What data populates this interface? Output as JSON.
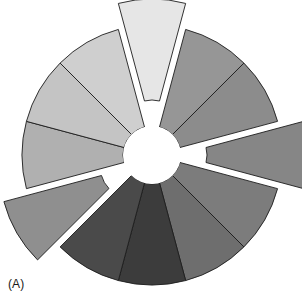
{
  "figure": {
    "panel_label": "(A)",
    "background_color": "#ffffff",
    "outline_color": "#1d1d1d",
    "hub_color": "#ffffff"
  },
  "chart_data": {
    "type": "pie",
    "title": "",
    "subtitle": "",
    "xlabel": "",
    "ylabel": "",
    "variant": "exploded-donut",
    "grid": false,
    "legend_position": "none",
    "center_x": 152,
    "center_y": 155,
    "outer_radius": 130,
    "inner_radius": 29,
    "start_angle_deg": -105,
    "direction": "clockwise",
    "explode_offset": 26,
    "categories": [
      "Segment 1",
      "Segment 2",
      "Segment 3",
      "Segment 4",
      "Segment 5",
      "Segment 6",
      "Segment 7",
      "Segment 8",
      "Segment 9",
      "Segment 10",
      "Segment 11",
      "Segment 12"
    ],
    "values": [
      8.33,
      8.33,
      8.33,
      8.33,
      8.33,
      8.33,
      8.33,
      8.33,
      8.33,
      8.33,
      8.33,
      8.33
    ],
    "slice_angles_deg": [
      30,
      30,
      30,
      30,
      30,
      30,
      30,
      30,
      30,
      30,
      30,
      30
    ],
    "colors": [
      "#e6e6e6",
      "#969696",
      "#8c8c8c",
      "#868686",
      "#7c7c7c",
      "#6e6e6e",
      "#3c3c3c",
      "#4a4a4a",
      "#8f8f8f",
      "#b0b0b0",
      "#c4c4c4",
      "#cfcfcf"
    ],
    "exploded": [
      true,
      false,
      false,
      true,
      false,
      false,
      false,
      false,
      true,
      false,
      false,
      false
    ],
    "slices": [
      {
        "label": "Segment 1",
        "value": 8.33,
        "color": "#e6e6e6",
        "exploded": true
      },
      {
        "label": "Segment 2",
        "value": 8.33,
        "color": "#969696",
        "exploded": false
      },
      {
        "label": "Segment 3",
        "value": 8.33,
        "color": "#8c8c8c",
        "exploded": false
      },
      {
        "label": "Segment 4",
        "value": 8.33,
        "color": "#868686",
        "exploded": true
      },
      {
        "label": "Segment 5",
        "value": 8.33,
        "color": "#7c7c7c",
        "exploded": false
      },
      {
        "label": "Segment 6",
        "value": 8.33,
        "color": "#6e6e6e",
        "exploded": false
      },
      {
        "label": "Segment 7",
        "value": 8.33,
        "color": "#3c3c3c",
        "exploded": false
      },
      {
        "label": "Segment 8",
        "value": 8.33,
        "color": "#4a4a4a",
        "exploded": false
      },
      {
        "label": "Segment 9",
        "value": 8.33,
        "color": "#8f8f8f",
        "exploded": true
      },
      {
        "label": "Segment 10",
        "value": 8.33,
        "color": "#b0b0b0",
        "exploded": false
      },
      {
        "label": "Segment 11",
        "value": 8.33,
        "color": "#c4c4c4",
        "exploded": false
      },
      {
        "label": "Segment 12",
        "value": 8.33,
        "color": "#cfcfcf",
        "exploded": false
      }
    ]
  }
}
